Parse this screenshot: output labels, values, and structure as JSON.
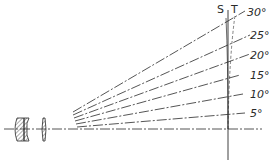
{
  "diagram": {
    "image_plane_labels": {
      "sagittal": "S",
      "tangential": "T"
    },
    "field_angles": [
      {
        "label": "30°",
        "y": 11
      },
      {
        "label": "25°",
        "y": 35
      },
      {
        "label": "20°",
        "y": 54
      },
      {
        "label": "15°",
        "y": 74
      },
      {
        "label": "10°",
        "y": 94
      },
      {
        "label": "5°",
        "y": 113
      }
    ],
    "colors": {
      "ink": "#2a2a2a",
      "background": "#ffffff"
    }
  }
}
